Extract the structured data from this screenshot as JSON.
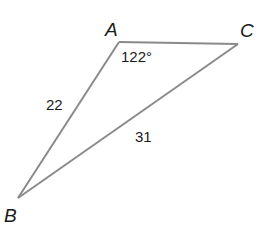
{
  "diagram": {
    "type": "triangle",
    "vertices": [
      {
        "name": "A",
        "x": 119,
        "y": 42,
        "label_x": 105,
        "label_y": 36
      },
      {
        "name": "B",
        "x": 18,
        "y": 198,
        "label_x": 4,
        "label_y": 222
      },
      {
        "name": "C",
        "x": 238,
        "y": 44,
        "label_x": 240,
        "label_y": 37
      }
    ],
    "sides": [
      {
        "from": "A",
        "to": "B",
        "length_label": "22",
        "label_x": 46,
        "label_y": 110
      },
      {
        "from": "B",
        "to": "C",
        "length_label": "31",
        "label_x": 135,
        "label_y": 142
      },
      {
        "from": "A",
        "to": "C",
        "length_label": ""
      }
    ],
    "angles": [
      {
        "vertex": "A",
        "label": "122°",
        "label_x": 121,
        "label_y": 62
      }
    ],
    "colors": {
      "stroke": "#8a8a8a",
      "text": "#1a1a1a",
      "background": "#ffffff"
    }
  }
}
